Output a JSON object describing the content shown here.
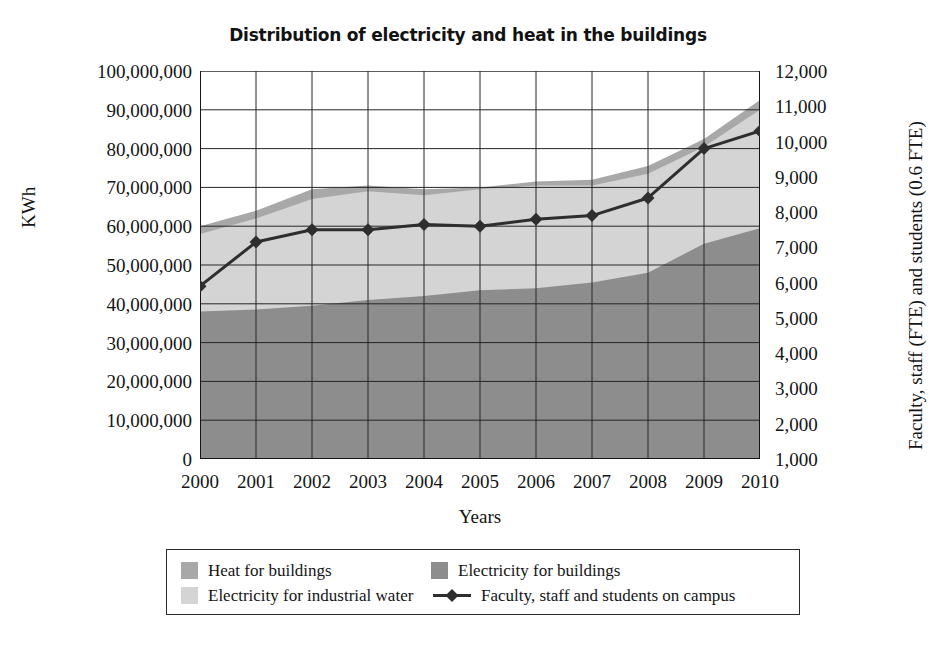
{
  "chart_data": {
    "type": "area",
    "title": "Distribution of electricity and heat in the buildings",
    "xlabel": "Years",
    "ylabel": "KWh",
    "ylabel_right": "Faculty, staff (FTE) and students (0.6 FTE)",
    "categories": [
      "2000",
      "2001",
      "2002",
      "2003",
      "2004",
      "2005",
      "2006",
      "2007",
      "2008",
      "2009",
      "2010"
    ],
    "x": [
      2000,
      2001,
      2002,
      2003,
      2004,
      2005,
      2006,
      2007,
      2008,
      2009,
      2010
    ],
    "ylim": [
      0,
      100000000
    ],
    "ylim_right": [
      1000,
      12000
    ],
    "ytick_step": 10000000,
    "ytick_step_right": 1000,
    "grid": true,
    "stacked": true,
    "legend_position": "bottom",
    "yticks": [
      "0",
      "10,000,000",
      "20,000,000",
      "30,000,000",
      "40,000,000",
      "50,000,000",
      "60,000,000",
      "70,000,000",
      "80,000,000",
      "90,000,000",
      "100,000,000"
    ],
    "yticks_right": [
      "1,000",
      "2,000",
      "3,000",
      "4,000",
      "5,000",
      "6,000",
      "7,000",
      "8,000",
      "9,000",
      "10,000",
      "11,000",
      "12,000"
    ],
    "series": [
      {
        "name": "Electricity for buildings",
        "type": "area",
        "stack_order": 1,
        "color": "#8d8d8d",
        "axis": "left",
        "values": [
          38000000,
          38500000,
          39500000,
          41000000,
          42000000,
          43500000,
          44000000,
          45500000,
          48000000,
          55500000,
          59500000
        ]
      },
      {
        "name": "Electricity for industrial water",
        "type": "area",
        "stack_order": 2,
        "color": "#d4d4d4",
        "axis": "left",
        "values": [
          20000000,
          23500000,
          27500000,
          28000000,
          26000000,
          26000000,
          26500000,
          25000000,
          25500000,
          25000000,
          30500000
        ]
      },
      {
        "name": "Heat for buildings",
        "type": "area",
        "stack_order": 3,
        "color": "#a8a8a8",
        "axis": "left",
        "values": [
          2000000,
          2000000,
          2500000,
          1500000,
          1500000,
          500000,
          1000000,
          1500000,
          2000000,
          2000000,
          2500000
        ]
      },
      {
        "name": "Faculty, staff and students on campus",
        "type": "line",
        "color": "#2e2e2e",
        "marker": "diamond",
        "axis": "right",
        "values": [
          5900,
          7150,
          7500,
          7500,
          7650,
          7600,
          7800,
          7900,
          8400,
          9800,
          10300
        ]
      }
    ],
    "totals": [
      60000000,
      64000000,
      69500000,
      70500000,
      69500000,
      70000000,
      71500000,
      72000000,
      75500000,
      82500000,
      92500000
    ]
  },
  "legend": {
    "items": [
      {
        "label": "Heat for buildings",
        "swatch": "#a8a8a8",
        "marker": "square"
      },
      {
        "label": "Electricity for buildings",
        "swatch": "#8d8d8d",
        "marker": "square"
      },
      {
        "label": "Electricity for industrial water",
        "swatch": "#d4d4d4",
        "marker": "square"
      },
      {
        "label": "Faculty, staff and students on campus",
        "swatch": "#2e2e2e",
        "marker": "diamond-line"
      }
    ]
  }
}
